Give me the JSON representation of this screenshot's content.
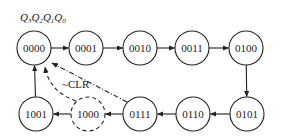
{
  "diagram": {
    "title_label": "Q3Q2Q1Q0",
    "title_parts": [
      "Q",
      "3",
      "Q",
      "2",
      "Q",
      "1",
      "Q",
      "0"
    ],
    "reset_label": "~CLR",
    "states": [
      {
        "id": "s0",
        "label": "0000",
        "cx": 34,
        "cy": 48,
        "style": "solid"
      },
      {
        "id": "s1",
        "label": "0001",
        "cx": 86,
        "cy": 48,
        "style": "solid"
      },
      {
        "id": "s2",
        "label": "0010",
        "cx": 140,
        "cy": 48,
        "style": "solid"
      },
      {
        "id": "s3",
        "label": "0011",
        "cx": 192,
        "cy": 48,
        "style": "solid"
      },
      {
        "id": "s4",
        "label": "0100",
        "cx": 246,
        "cy": 48,
        "style": "solid"
      },
      {
        "id": "s5",
        "label": "0101",
        "cx": 247,
        "cy": 114,
        "style": "solid"
      },
      {
        "id": "s6",
        "label": "0110",
        "cx": 193,
        "cy": 114,
        "style": "solid"
      },
      {
        "id": "s7",
        "label": "0111",
        "cx": 140,
        "cy": 114,
        "style": "solid"
      },
      {
        "id": "s8",
        "label": "1000",
        "cx": 88,
        "cy": 114,
        "style": "dashed"
      },
      {
        "id": "s9",
        "label": "1001",
        "cx": 36,
        "cy": 114,
        "style": "solid"
      }
    ],
    "transitions": [
      {
        "from": "0000",
        "to": "0001",
        "style": "solid"
      },
      {
        "from": "0001",
        "to": "0010",
        "style": "solid"
      },
      {
        "from": "0010",
        "to": "0011",
        "style": "solid"
      },
      {
        "from": "0011",
        "to": "0100",
        "style": "solid"
      },
      {
        "from": "0100",
        "to": "0101",
        "style": "solid"
      },
      {
        "from": "0101",
        "to": "0110",
        "style": "solid"
      },
      {
        "from": "0110",
        "to": "0111",
        "style": "solid"
      },
      {
        "from": "0111",
        "to": "1000",
        "style": "solid"
      },
      {
        "from": "1000",
        "to": "1001",
        "style": "solid"
      },
      {
        "from": "1001",
        "to": "0000",
        "style": "solid"
      },
      {
        "from": "1000",
        "to": "0000",
        "style": "dashed",
        "label": "~CLR"
      },
      {
        "from": "0111",
        "to": "0000",
        "style": "dash-dot"
      }
    ]
  }
}
